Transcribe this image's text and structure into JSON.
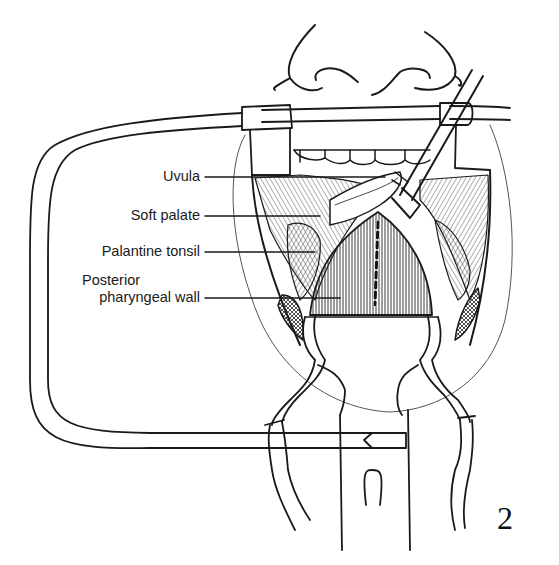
{
  "figure": {
    "number": "2",
    "labels": [
      {
        "text": "Uvula",
        "target": "uvula"
      },
      {
        "text": "Soft palate",
        "target": "soft-palate"
      },
      {
        "text": "Palantine tonsil",
        "target": "palatine-tonsil"
      },
      {
        "text": "Posterior",
        "target": "posterior-pharyngeal-wall"
      },
      {
        "text": "pharyngeal wall",
        "target": "posterior-pharyngeal-wall"
      }
    ],
    "colors": {
      "ink": "#1a1a1a",
      "background": "#ffffff"
    }
  }
}
